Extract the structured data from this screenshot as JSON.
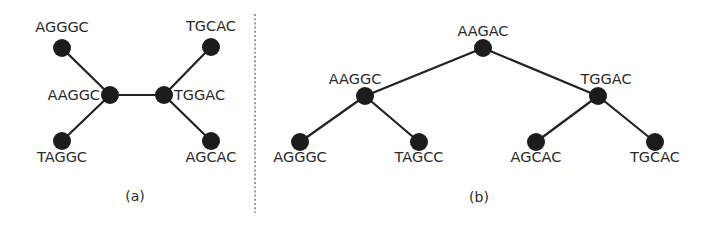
{
  "colors": {
    "node": "#1c1c1c",
    "edge": "#222222",
    "text": "#2a2a2a",
    "divider": "#555555",
    "background": "#ffffff"
  },
  "panels": [
    {
      "id": "a",
      "caption": "(a)",
      "caption_pos": [
        135,
        201
      ],
      "nodes": [
        {
          "id": "a_agggc",
          "label": "AGGGC",
          "x": 62,
          "y": 48,
          "lx": 62,
          "ly": 32,
          "anchor": "middle"
        },
        {
          "id": "a_aaggc",
          "label": "AAGGC",
          "x": 110,
          "y": 95,
          "lx": 100,
          "ly": 100,
          "anchor": "end"
        },
        {
          "id": "a_taggc",
          "label": "TAGGC",
          "x": 62,
          "y": 141,
          "lx": 62,
          "ly": 162,
          "anchor": "middle"
        },
        {
          "id": "a_tggac",
          "label": "TGGAC",
          "x": 164,
          "y": 95,
          "lx": 174,
          "ly": 100,
          "anchor": "start"
        },
        {
          "id": "a_tgcac",
          "label": "TGCAC",
          "x": 211,
          "y": 47,
          "lx": 211,
          "ly": 31,
          "anchor": "middle"
        },
        {
          "id": "a_agcac",
          "label": "AGCAC",
          "x": 211,
          "y": 141,
          "lx": 211,
          "ly": 162,
          "anchor": "middle"
        }
      ],
      "edges": [
        [
          "a_agggc",
          "a_aaggc"
        ],
        [
          "a_taggc",
          "a_aaggc"
        ],
        [
          "a_aaggc",
          "a_tggac"
        ],
        [
          "a_tggac",
          "a_tgcac"
        ],
        [
          "a_tggac",
          "a_agcac"
        ]
      ]
    },
    {
      "id": "b",
      "caption": "(b)",
      "caption_pos": [
        479,
        202
      ],
      "nodes": [
        {
          "id": "b_aagac",
          "label": "AAGAC",
          "x": 483,
          "y": 48,
          "lx": 483,
          "ly": 36,
          "anchor": "middle"
        },
        {
          "id": "b_aaggc",
          "label": "AAGGC",
          "x": 365,
          "y": 96,
          "lx": 355,
          "ly": 84,
          "anchor": "middle"
        },
        {
          "id": "b_tggac",
          "label": "TGGAC",
          "x": 598,
          "y": 96,
          "lx": 606,
          "ly": 84,
          "anchor": "middle"
        },
        {
          "id": "b_agggc",
          "label": "AGGGC",
          "x": 300,
          "y": 142,
          "lx": 300,
          "ly": 162,
          "anchor": "middle"
        },
        {
          "id": "b_tagcc",
          "label": "TAGCC",
          "x": 419,
          "y": 142,
          "lx": 419,
          "ly": 162,
          "anchor": "middle"
        },
        {
          "id": "b_agcac",
          "label": "AGCAC",
          "x": 536,
          "y": 142,
          "lx": 536,
          "ly": 162,
          "anchor": "middle"
        },
        {
          "id": "b_tgcac",
          "label": "TGCAC",
          "x": 655,
          "y": 142,
          "lx": 655,
          "ly": 162,
          "anchor": "middle"
        }
      ],
      "edges": [
        [
          "b_aagac",
          "b_aaggc"
        ],
        [
          "b_aagac",
          "b_tggac"
        ],
        [
          "b_aaggc",
          "b_agggc"
        ],
        [
          "b_aaggc",
          "b_tagcc"
        ],
        [
          "b_tggac",
          "b_agcac"
        ],
        [
          "b_tggac",
          "b_tgcac"
        ]
      ]
    }
  ],
  "divider": {
    "x": 255,
    "y1": 14,
    "y2": 213
  },
  "node_radius": 9
}
